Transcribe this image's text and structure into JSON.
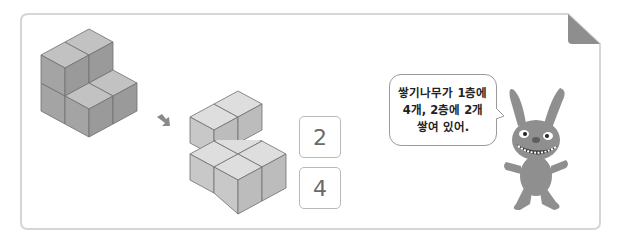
{
  "figure": {
    "original_shape": {
      "label": "L-shaped stacked cube structure",
      "cube_count": 6
    },
    "arrow": {
      "icon": "arrow-down-right-icon"
    },
    "split_shape": {
      "top_layer": {
        "label": "2nd floor cubes",
        "cube_count": 2
      },
      "bottom_layer": {
        "label": "1st floor cubes",
        "cube_count": 4
      }
    },
    "answers": [
      {
        "layer": "2nd floor",
        "value": "2"
      },
      {
        "layer": "1st floor",
        "value": "4"
      }
    ]
  },
  "speech_bubble": {
    "lines": [
      "쌓기나무가 1층에",
      "4개, 2층에 2개",
      "쌓여 있어."
    ]
  },
  "character": {
    "name": "gray-rabbit-character"
  },
  "colors": {
    "card_border": "#d6d6d6",
    "cube_dark_face": "#9c9c9c",
    "cube_mid_face": "#b0b0b0",
    "cube_top_face": "#c6c6c6",
    "cube_light_top": "#dedede",
    "cube_light_side": "#c4c4c4",
    "fold": "#8e8e8e",
    "answer_text": "#6a6a6a"
  }
}
